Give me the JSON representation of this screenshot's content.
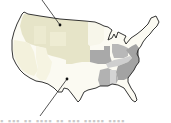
{
  "map": {
    "subject": "United States (contiguous)",
    "colors": {
      "outline": "#1e1e1e",
      "light_khaki": "#e6e4c8",
      "pale_cream": "#f3f1dc",
      "white_region": "#fbfaf2",
      "gray_dark": "#a7a7a7",
      "gray_mid": "#b9b9b9",
      "gray_light": "#d0d0d0",
      "leader_line": "#2a2a2a"
    },
    "callouts": [
      {
        "id": "callout-north",
        "points_to": "northern plains region",
        "from": [
          42,
          0
        ],
        "to": [
          60,
          25
        ]
      },
      {
        "id": "callout-south",
        "points_to": "southern plains region",
        "from": [
          40,
          116
        ],
        "to": [
          67,
          79
        ]
      }
    ]
  },
  "footer": {
    "cut_off_text": "▪ ▪▪▪ ▪▪ ▪▪▪▪ ▪▪ ▪▪▪ ▪▪▪▪▪ ▪▪▪▪"
  }
}
